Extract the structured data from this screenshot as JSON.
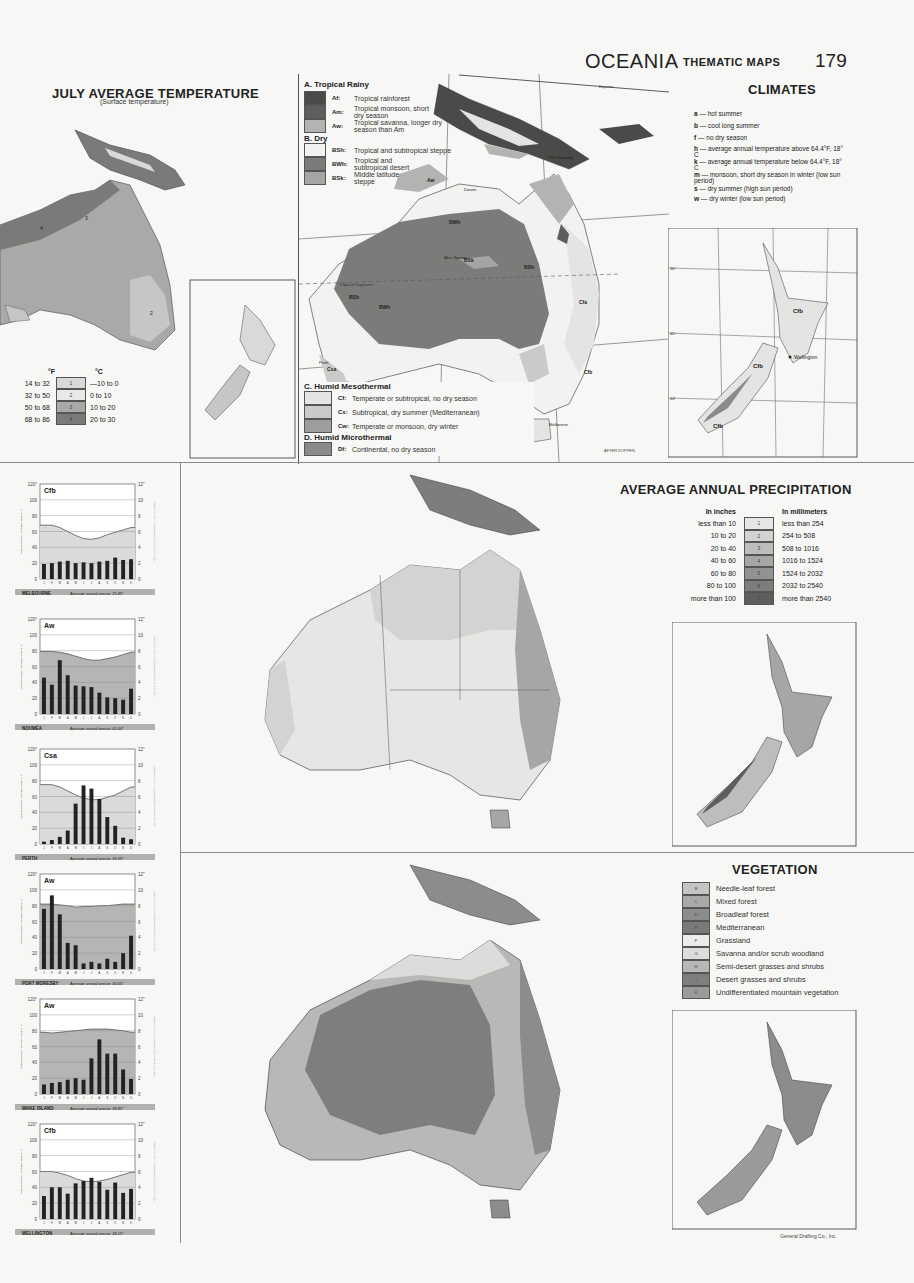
{
  "header": {
    "title": "OCEANIA",
    "subtitle": "THEMATIC MAPS",
    "page_number": "179"
  },
  "july_temperature": {
    "title": "JULY AVERAGE TEMPERATURE",
    "subtitle": "(Surface temperature)",
    "legend_header_f": "°F",
    "legend_header_c": "°C",
    "legend": [
      {
        "f": "14 to 32",
        "code": "1",
        "c": "—10 to 0",
        "color": "#d9d9d7"
      },
      {
        "f": "32 to 50",
        "code": "2",
        "c": "0 to 10",
        "color": "#c6c6c4"
      },
      {
        "f": "50 to 68",
        "code": "3",
        "c": "10 to 20",
        "color": "#a9a9a7"
      },
      {
        "f": "68 to 86",
        "code": "4",
        "c": "20 to 30",
        "color": "#7a7a78"
      }
    ]
  },
  "climates": {
    "title": "CLIMATES",
    "groups": [
      {
        "name": "A. Tropical Rainy",
        "items": [
          {
            "code": "Af:",
            "desc": "Tropical rainforest",
            "color": "#4a4a48"
          },
          {
            "code": "Am:",
            "desc": "Tropical monsoon, short dry season",
            "color": "#5e5e5c"
          },
          {
            "code": "Aw:",
            "desc": "Tropical savanna, longer dry season than Am",
            "color": "#b3b3b1"
          }
        ]
      },
      {
        "name": "B. Dry",
        "items": [
          {
            "code": "BSh:",
            "desc": "Tropical and subtropical steppe",
            "color": "#f2f2f0"
          },
          {
            "code": "BWh:",
            "desc": "Tropical and subtropical desert",
            "color": "#7b7b79"
          },
          {
            "code": "BSk:",
            "desc": "Middle latitude steppe",
            "color": "#a5a5a3"
          }
        ]
      },
      {
        "name": "C. Humid Mesothermal",
        "items": [
          {
            "code": "Cf:",
            "desc": "Temperate or subtropical, no dry season",
            "color": "#e4e4e2"
          },
          {
            "code": "Cs:",
            "desc": "Subtropical, dry summer (Mediterranean)",
            "color": "#cacac8"
          },
          {
            "code": "Cw:",
            "desc": "Temperate or monsoon, dry winter",
            "color": "#9d9d9b"
          }
        ]
      },
      {
        "name": "D. Humid Microthermal",
        "items": [
          {
            "code": "Df:",
            "desc": "Continental, no dry season",
            "color": "#8a8a88"
          }
        ]
      }
    ],
    "key": [
      {
        "letter": "a",
        "desc": "hot summer"
      },
      {
        "letter": "b",
        "desc": "cool long summer"
      },
      {
        "letter": "f",
        "desc": "no dry season"
      },
      {
        "letter": "h",
        "desc": "average annual temperature above 64.4°F, 18° C"
      },
      {
        "letter": "k",
        "desc": "average annual temperature below 64.4°F, 18° C"
      },
      {
        "letter": "m",
        "desc": "monsoon, short dry season in winter (low sun period)"
      },
      {
        "letter": "s",
        "desc": "dry summer (high sun period)"
      },
      {
        "letter": "w",
        "desc": "dry winter (low sun period)"
      }
    ],
    "map_labels": {
      "equator": "Equator",
      "port_moresby": "Port Moresby",
      "darwin": "Darwin",
      "halls_creek": "Halls Creek",
      "alice_springs": "Alice Springs",
      "tropic": "Tropic of Capricorn",
      "perth": "Perth",
      "melbourne": "Melbourne",
      "wellington": "Wellington",
      "credit": "AFTER KÖPPEN"
    },
    "nz_lat_labels": [
      "36°",
      "40°",
      "44°"
    ],
    "nz_lon_labels": [
      "166°",
      "170°",
      "174°",
      "178°"
    ],
    "lon_labels": [
      "110°",
      "120°",
      "130°",
      "140°",
      "150°",
      "160°"
    ],
    "lat_labels": [
      "0°",
      "10°",
      "20°",
      "30°",
      "40°"
    ]
  },
  "precipitation": {
    "title": "AVERAGE ANNUAL PRECIPITATION",
    "header_in": "In inches",
    "header_mm": "In millimeters",
    "legend": [
      {
        "in": "less than 10",
        "code": "1",
        "mm": "less than 254",
        "color": "#e6e6e4"
      },
      {
        "in": "10 to 20",
        "code": "2",
        "mm": "254 to 508",
        "color": "#d3d3d1"
      },
      {
        "in": "20 to 40",
        "code": "3",
        "mm": "508 to 1016",
        "color": "#bdbdbb"
      },
      {
        "in": "40 to 60",
        "code": "4",
        "mm": "1016 to 1524",
        "color": "#a6a6a4"
      },
      {
        "in": "60 to 80",
        "code": "5",
        "mm": "1524 to 2032",
        "color": "#929290"
      },
      {
        "in": "80 to 100",
        "code": "6",
        "mm": "2032 to 2540",
        "color": "#7d7d7b"
      },
      {
        "in": "more than 100",
        "code": "7",
        "mm": "more than 2540",
        "color": "#5e5e5c"
      }
    ]
  },
  "vegetation": {
    "title": "VEGETATION",
    "legend": [
      {
        "code": "B",
        "desc": "Needle-leaf forest",
        "color": "#c4c4c2"
      },
      {
        "code": "C",
        "desc": "Mixed forest",
        "color": "#a9a9a7"
      },
      {
        "code": "D",
        "desc": "Broadleaf forest",
        "color": "#8c8c8a"
      },
      {
        "code": "E",
        "desc": "Mediterranean",
        "color": "#7a7a78"
      },
      {
        "code": "F",
        "desc": "Grassland",
        "color": "#ececea"
      },
      {
        "code": "G",
        "desc": "Savanna and/or scrub woodland",
        "color": "#dcdcda"
      },
      {
        "code": "H",
        "desc": "Semi-desert grasses and shrubs",
        "color": "#b8b8b6"
      },
      {
        "code": "I",
        "desc": "Desert grasses and shrubs",
        "color": "#7e7e7c"
      },
      {
        "code": "K",
        "desc": "Undifferentiated mountain vegetation",
        "color": "#9a9a98"
      }
    ]
  },
  "footer": {
    "credit": "General Drafting Co., Inc."
  },
  "chart_data": [
    {
      "type": "bar",
      "title": "MELBOURNE",
      "climate": "Cfb",
      "caption": "Average annual precip: 25.89\"",
      "categories": [
        "J",
        "F",
        "M",
        "A",
        "M",
        "J",
        "J",
        "A",
        "S",
        "O",
        "N",
        "D"
      ],
      "series": [
        {
          "name": "Precipitation (in)",
          "values": [
            1.9,
            2.0,
            2.2,
            2.3,
            2.0,
            2.1,
            2.0,
            2.2,
            2.3,
            2.7,
            2.4,
            2.5
          ]
        },
        {
          "name": "Temperature (°F)",
          "values": [
            68,
            68,
            65,
            60,
            55,
            51,
            50,
            52,
            56,
            59,
            62,
            65
          ]
        }
      ],
      "ylim_left": [
        0,
        120
      ],
      "ylim_right": [
        0,
        12
      ],
      "ylabel_left": "CURVE SHOWS TEMPERATURE IN °F",
      "ylabel_right": "VERTICAL BARS SHOW PRECIPITATION IN INCHES"
    },
    {
      "type": "bar",
      "title": "NOUMÉA",
      "climate": "Aw",
      "caption": "Average annual precip: 42.64\"",
      "categories": [
        "J",
        "F",
        "M",
        "A",
        "M",
        "J",
        "J",
        "A",
        "S",
        "O",
        "N",
        "D"
      ],
      "series": [
        {
          "name": "Precipitation (in)",
          "values": [
            4.6,
            3.7,
            6.8,
            4.9,
            3.6,
            3.5,
            3.4,
            2.7,
            2.1,
            2.0,
            1.8,
            3.2
          ]
        },
        {
          "name": "Temperature (°F)",
          "values": [
            79,
            79,
            78,
            76,
            73,
            70,
            68,
            68,
            70,
            72,
            75,
            78
          ]
        }
      ],
      "ylim_left": [
        0,
        120
      ],
      "ylim_right": [
        0,
        12
      ]
    },
    {
      "type": "bar",
      "title": "PERTH",
      "climate": "Csa",
      "caption": "Average annual precip: 35.99\"",
      "categories": [
        "J",
        "F",
        "M",
        "A",
        "M",
        "J",
        "J",
        "A",
        "S",
        "O",
        "N",
        "D"
      ],
      "series": [
        {
          "name": "Precipitation (in)",
          "values": [
            0.3,
            0.5,
            0.9,
            1.7,
            5.1,
            7.4,
            7.0,
            5.7,
            3.4,
            2.3,
            0.8,
            0.6
          ]
        },
        {
          "name": "Temperature (°F)",
          "values": [
            75,
            75,
            72,
            67,
            62,
            58,
            56,
            56,
            59,
            62,
            67,
            72
          ]
        }
      ],
      "ylim_left": [
        0,
        120
      ],
      "ylim_right": [
        0,
        12
      ]
    },
    {
      "type": "bar",
      "title": "PORT MORESBY",
      "climate": "Aw",
      "caption": "Average annual precip: 40.63\"",
      "categories": [
        "J",
        "F",
        "M",
        "A",
        "M",
        "J",
        "J",
        "A",
        "S",
        "O",
        "N",
        "D"
      ],
      "series": [
        {
          "name": "Precipitation (in)",
          "values": [
            7.6,
            9.3,
            6.9,
            3.3,
            3.0,
            0.7,
            0.9,
            0.7,
            1.3,
            0.9,
            2.0,
            4.2
          ]
        },
        {
          "name": "Temperature (°F)",
          "values": [
            82,
            82,
            81,
            80,
            78,
            79,
            79,
            80,
            80,
            81,
            82,
            82
          ]
        }
      ],
      "ylim_left": [
        0,
        120
      ],
      "ylim_right": [
        0,
        12
      ]
    },
    {
      "type": "bar",
      "title": "WAKE ISLAND",
      "climate": "Aw",
      "caption": "Average annual precip: 36.85\"",
      "categories": [
        "J",
        "F",
        "M",
        "A",
        "M",
        "J",
        "J",
        "A",
        "S",
        "O",
        "N",
        "D"
      ],
      "series": [
        {
          "name": "Precipitation (in)",
          "values": [
            1.2,
            1.4,
            1.5,
            1.8,
            2.0,
            1.8,
            4.5,
            6.9,
            5.1,
            5.1,
            3.1,
            1.9
          ]
        },
        {
          "name": "Temperature (°F)",
          "values": [
            78,
            77,
            78,
            79,
            80,
            81,
            82,
            82,
            82,
            81,
            80,
            78
          ]
        }
      ],
      "ylim_left": [
        0,
        120
      ],
      "ylim_right": [
        0,
        12
      ]
    },
    {
      "type": "bar",
      "title": "WELLINGTON",
      "climate": "Cfb",
      "caption": "Average annual precip: 48.19\"",
      "categories": [
        "J",
        "F",
        "M",
        "A",
        "M",
        "J",
        "J",
        "A",
        "S",
        "O",
        "N",
        "D"
      ],
      "series": [
        {
          "name": "Precipitation (in)",
          "values": [
            2.9,
            4.0,
            4.0,
            3.2,
            4.5,
            4.8,
            5.2,
            4.7,
            3.7,
            4.6,
            3.3,
            3.8
          ]
        },
        {
          "name": "Temperature (°F)",
          "values": [
            60,
            60,
            58,
            55,
            51,
            48,
            47,
            48,
            50,
            53,
            56,
            59
          ]
        }
      ],
      "ylim_left": [
        0,
        120
      ],
      "ylim_right": [
        0,
        12
      ]
    }
  ],
  "chart_axis": {
    "left_ticks": [
      "0",
      "20",
      "40",
      "60",
      "80",
      "100",
      "120°"
    ],
    "right_ticks": [
      "0",
      "2",
      "4",
      "6",
      "8",
      "10",
      "12\""
    ],
    "months": [
      "J",
      "F",
      "M",
      "A",
      "M",
      "J",
      "J",
      "A",
      "S",
      "O",
      "N",
      "D"
    ],
    "ylabel_left": "CURVE SHOWS TEMPERATURE IN °F",
    "ylabel_right": "VERTICAL BARS SHOW PRECIPITATION IN INCHES"
  }
}
